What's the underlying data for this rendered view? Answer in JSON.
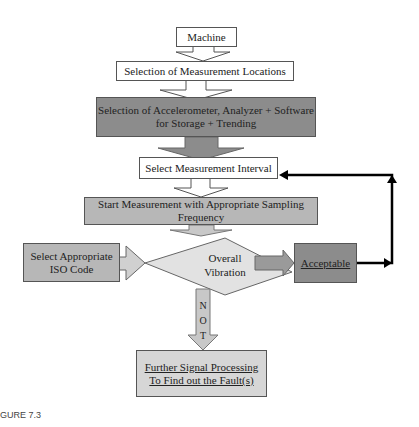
{
  "flowchart": {
    "nodes": {
      "machine": "Machine",
      "locations": "Selection of Measurement Locations",
      "equipment_line1": "Selection of Accelerometer, Analyzer + Software",
      "equipment_line2": "for Storage + Trending",
      "interval": "Select Measurement Interval",
      "start": "Start Measurement with Appropriate Sampling Frequency",
      "iso_line1": "Select Appropriate",
      "iso_line2": "ISO Code",
      "decision_line1": "Overall",
      "decision_line2": "Vibration",
      "acceptable": "Acceptable",
      "further_line1": "Further Signal Processing",
      "further_line2": "To Find out the Fault(s)"
    },
    "edge_labels": {
      "not_n": "N",
      "not_o": "O",
      "not_t": "T"
    },
    "colors": {
      "dark_box": "#8c8c8c",
      "mid_box": "#b7b7b7",
      "light_box": "#d6d6d6",
      "arrow_fill": "#a8a8a8",
      "feedback_line": "#000000"
    }
  },
  "caption": "GURE 7.3"
}
